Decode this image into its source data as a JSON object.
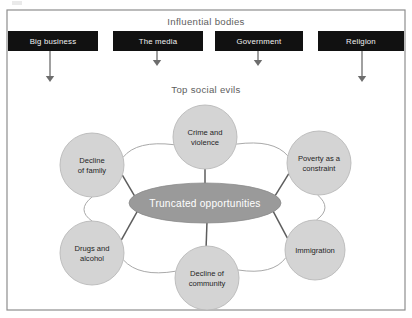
{
  "figure": {
    "influential_bodies_title": "Influential bodies",
    "social_evils_title": "Top social evils",
    "center_label": "Truncated opportunities",
    "colors": {
      "frame_border": "#8e8e8e",
      "box_fill": "#111111",
      "box_text": "#f2f2f2",
      "circle_fill": "#d4d4d4",
      "circle_stroke": "#b9b9b9",
      "center_fill": "#9a9a9a",
      "center_text": "#ffffff",
      "title_text": "#5e5e5e",
      "arrow": "#6d6d6d",
      "ring_link": "#a9a9a9",
      "spoke_link": "#5d5d5d"
    }
  },
  "influential_bodies": [
    {
      "label": "Big business",
      "x": 8,
      "y": 31,
      "w": 90,
      "h": 20,
      "text_x": 53,
      "text_y": 44,
      "arrow_x": 50,
      "arrow_y1": 51,
      "arrow_y2": 82
    },
    {
      "label": "The media",
      "x": 113,
      "y": 31,
      "w": 90,
      "h": 20,
      "text_x": 158,
      "text_y": 44,
      "arrow_x": 157,
      "arrow_y1": 51,
      "arrow_y2": 66
    },
    {
      "label": "Government",
      "x": 215,
      "y": 31,
      "w": 88,
      "h": 20,
      "text_x": 259,
      "text_y": 44,
      "arrow_x": 258,
      "arrow_y1": 51,
      "arrow_y2": 66
    },
    {
      "label": "Religion",
      "x": 318,
      "y": 31,
      "w": 86,
      "h": 20,
      "text_x": 361,
      "text_y": 44,
      "arrow_x": 362,
      "arrow_y1": 51,
      "arrow_y2": 82
    }
  ],
  "social_evils": [
    {
      "name": "crime-and-violence",
      "lines": [
        "Crime and",
        "violence"
      ],
      "cx": 205,
      "cy": 137,
      "r": 32
    },
    {
      "name": "poverty-constraint",
      "lines": [
        "Poverty as a",
        "constraint"
      ],
      "cx": 319,
      "cy": 163,
      "r": 32
    },
    {
      "name": "immigration",
      "lines": [
        "Immigration"
      ],
      "cx": 315,
      "cy": 250,
      "r": 30
    },
    {
      "name": "decline-of-community",
      "lines": [
        "Decline of",
        "community"
      ],
      "cx": 207,
      "cy": 278,
      "r": 32
    },
    {
      "name": "drugs-and-alcohol",
      "lines": [
        "Drugs and",
        "alcohol"
      ],
      "cx": 92,
      "cy": 253,
      "r": 32
    },
    {
      "name": "decline-of-family",
      "lines": [
        "Decline",
        "of family"
      ],
      "cx": 92,
      "cy": 165,
      "r": 32
    }
  ],
  "center_node": {
    "cx": 205,
    "cy": 203,
    "rx": 76,
    "ry": 20
  },
  "frame": {
    "x": 7,
    "y": 10,
    "w": 398,
    "h": 300
  },
  "titles": {
    "influential_bodies_x": 206,
    "influential_bodies_y": 25,
    "social_evils_x": 206,
    "social_evils_y": 93
  }
}
